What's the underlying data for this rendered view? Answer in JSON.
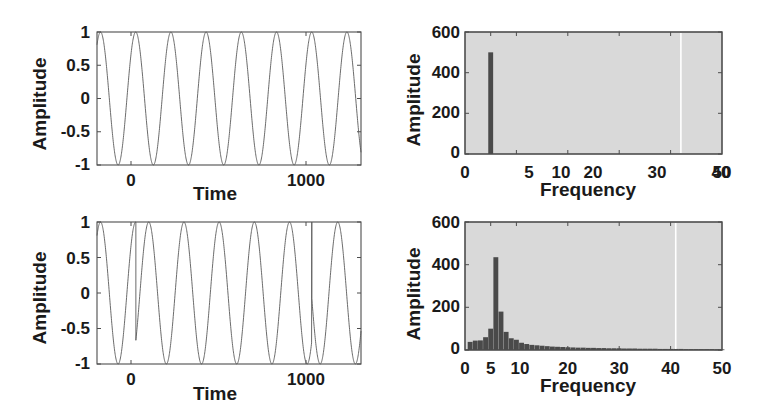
{
  "figure": {
    "width": 765,
    "height": 404,
    "background": "#ffffff",
    "panel_background_signal": "#ffffff",
    "panel_background_spectrum": "#d9d9d9",
    "axis_color": "#4d4d4d",
    "line_color": "#555555",
    "bar_color": "#4a4a4a",
    "artifact_line_color": "#ffffff"
  },
  "chart_data": [
    {
      "id": "top-left-signal",
      "type": "line",
      "title": "",
      "xlabel": "Time",
      "ylabel": "Amplitude",
      "xlim": [
        -220,
        1280
      ],
      "ylim": [
        -1,
        1
      ],
      "xticks": [
        0,
        1000
      ],
      "xticklabels": [
        "0",
        "1000"
      ],
      "yticks": [
        -1,
        -0.5,
        0,
        0.5,
        1
      ],
      "yticklabels": [
        "-1",
        "-0.5",
        "0",
        "0.5",
        "1"
      ],
      "grid": false,
      "legend": "none",
      "series": [
        {
          "name": "clean sinusoid",
          "description": "Pure sine wave, amplitude 1, period approx 200 time units, continuous phase across whole record",
          "amplitude": 1.0,
          "period": 200,
          "phase_offset": 0,
          "cycles_visible": 7.5,
          "discontinuities": []
        }
      ]
    },
    {
      "id": "top-right-spectrum",
      "type": "bar",
      "title": "",
      "xlabel": "Frequency",
      "ylabel": "Amplitude",
      "xlim": [
        0,
        50
      ],
      "ylim": [
        0,
        600
      ],
      "xticks": [
        0,
        5,
        10,
        20,
        30,
        40,
        50
      ],
      "xticklabels": [
        "0",
        "5",
        "10",
        "20",
        "30",
        "40",
        "50"
      ],
      "yticks": [
        0,
        200,
        400,
        600
      ],
      "yticklabels": [
        "0",
        "200",
        "400",
        "600"
      ],
      "grid": false,
      "legend": "none",
      "artifact_vertical_line_x": 42,
      "categories": [
        1,
        2,
        3,
        4,
        5,
        6,
        7,
        8,
        9,
        10,
        11,
        12,
        13,
        14,
        15,
        16,
        17,
        18,
        19,
        20,
        21,
        22,
        23,
        24,
        25,
        26,
        27,
        28,
        29,
        30,
        31,
        32,
        33,
        34,
        35,
        36,
        37,
        38,
        39,
        40,
        41,
        42,
        43,
        44,
        45,
        46,
        47,
        48,
        49,
        50
      ],
      "values": [
        0,
        0,
        0,
        0,
        500,
        0,
        0,
        0,
        0,
        0,
        0,
        0,
        0,
        0,
        0,
        0,
        0,
        0,
        0,
        0,
        0,
        0,
        0,
        0,
        0,
        0,
        0,
        0,
        0,
        0,
        0,
        0,
        0,
        0,
        0,
        0,
        0,
        0,
        0,
        0,
        0,
        0,
        0,
        0,
        0,
        0,
        0,
        0,
        0,
        0
      ],
      "peak": {
        "frequency": 5,
        "amplitude": 500
      }
    },
    {
      "id": "bottom-left-signal",
      "type": "line",
      "title": "",
      "xlabel": "Time",
      "ylabel": "Amplitude",
      "xlim": [
        -220,
        1280
      ],
      "ylim": [
        -1,
        1
      ],
      "xticks": [
        0,
        1000
      ],
      "xticklabels": [
        "0",
        "1000"
      ],
      "yticks": [
        -1,
        -0.5,
        0,
        0.5,
        1
      ],
      "yticklabels": [
        "-1",
        "-0.5",
        "0",
        "0.5",
        "1"
      ],
      "grid": false,
      "legend": "none",
      "series": [
        {
          "name": "phase-discontinuous sinusoid",
          "description": "Sine wave of same amplitude and period, but with abrupt phase jumps (vertical drops from 1 to about 0) at t=0 and t=1000",
          "amplitude": 1.0,
          "period": 200,
          "cycles_visible": 7.5,
          "discontinuities": [
            {
              "time": 0,
              "from_value": 1.0,
              "to_value": 0.05
            },
            {
              "time": 1000,
              "from_value": 1.0,
              "to_value": 0.05
            }
          ]
        }
      ]
    },
    {
      "id": "bottom-right-spectrum",
      "type": "bar",
      "title": "",
      "xlabel": "Frequency",
      "ylabel": "Amplitude",
      "xlim": [
        0,
        50
      ],
      "ylim": [
        0,
        600
      ],
      "xticks": [
        0,
        5,
        10,
        20,
        30,
        40,
        50
      ],
      "xticklabels": [
        "0",
        "5",
        "10",
        "20",
        "30",
        "40",
        "50"
      ],
      "yticks": [
        0,
        200,
        400,
        600
      ],
      "yticklabels": [
        "0",
        "200",
        "400",
        "600"
      ],
      "grid": false,
      "legend": "none",
      "artifact_vertical_line_x": 41,
      "categories": [
        1,
        2,
        3,
        4,
        5,
        6,
        7,
        8,
        9,
        10,
        11,
        12,
        13,
        14,
        15,
        16,
        17,
        18,
        19,
        20,
        21,
        22,
        23,
        24,
        25,
        26,
        27,
        28,
        29,
        30,
        31,
        32,
        33,
        34,
        35,
        36,
        37,
        38,
        39,
        40,
        41,
        42,
        43,
        44,
        45,
        46,
        47,
        48,
        49,
        50
      ],
      "values": [
        38,
        44,
        45,
        60,
        100,
        435,
        180,
        85,
        55,
        48,
        34,
        28,
        24,
        22,
        20,
        18,
        16,
        15,
        14,
        13,
        12,
        11,
        11,
        10,
        10,
        9,
        9,
        8,
        8,
        8,
        7,
        7,
        7,
        6,
        6,
        6,
        6,
        5,
        5,
        5,
        5,
        5,
        4,
        4,
        4,
        4,
        4,
        4,
        3,
        3
      ],
      "peak": {
        "frequency": 5,
        "amplitude": 435
      }
    }
  ],
  "panels": [
    {
      "name": "top-left-signal",
      "ylabel": "Amplitude",
      "xlabel": "Time",
      "xticklabels": [
        "0",
        "1000"
      ],
      "yticklabels": [
        "1",
        "0.5",
        "0",
        "-0.5",
        "-1"
      ]
    },
    {
      "name": "top-right-spectrum",
      "ylabel": "Amplitude",
      "xlabel": "Frequency",
      "xticklabels": [
        "0",
        "5",
        "10",
        "20",
        "30",
        "40",
        "50"
      ],
      "yticklabels": [
        "600",
        "400",
        "200",
        "0"
      ]
    },
    {
      "name": "bottom-left-signal",
      "ylabel": "Amplitude",
      "xlabel": "Time",
      "xticklabels": [
        "0",
        "1000"
      ],
      "yticklabels": [
        "1",
        "0.5",
        "0",
        "-0.5",
        "-1"
      ]
    },
    {
      "name": "bottom-right-spectrum",
      "ylabel": "Amplitude",
      "xlabel": "Frequency",
      "xticklabels": [
        "0",
        "5",
        "10",
        "20",
        "30",
        "40",
        "50"
      ],
      "yticklabels": [
        "600",
        "400",
        "200",
        "0"
      ]
    }
  ]
}
